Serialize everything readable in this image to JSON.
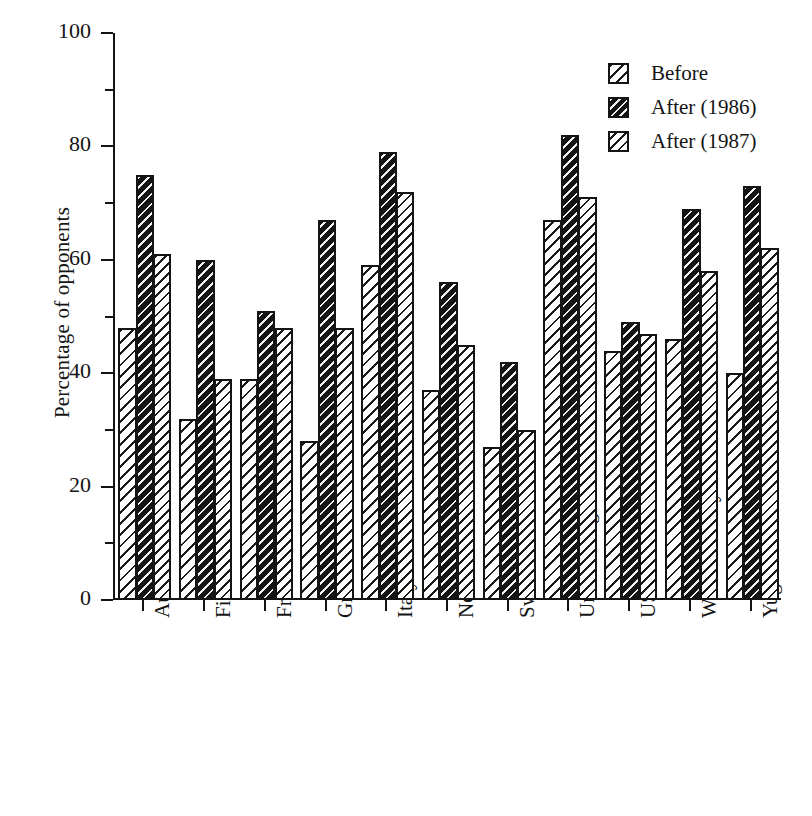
{
  "chart_data": {
    "type": "bar",
    "title": "",
    "subtitle": "",
    "xlabel": "",
    "ylabel": "Percentage of opponents",
    "ylim": [
      0,
      100
    ],
    "yticks": [
      0,
      20,
      40,
      60,
      80,
      100
    ],
    "ytick_labels": [
      "0",
      "20",
      "40",
      "60",
      "80",
      "100"
    ],
    "yminor_ticks": [
      10,
      30,
      50,
      70,
      90
    ],
    "grid": false,
    "legend_position": "top-right",
    "categories": [
      "Austria",
      "Finland",
      "France",
      "Greece",
      "Italy",
      "Netherlands",
      "Sweden",
      "United Kingdom",
      "USA",
      "West-Germany",
      "Yugoslavia"
    ],
    "series": [
      {
        "name": "Before",
        "pattern": "light-diagonal-hatch",
        "values": [
          48,
          32,
          39,
          28,
          59,
          37,
          27,
          67,
          44,
          46,
          40
        ]
      },
      {
        "name": "After (1986)",
        "pattern": "dark-diagonal-hatch",
        "values": [
          75,
          60,
          51,
          67,
          79,
          56,
          42,
          82,
          49,
          69,
          73
        ]
      },
      {
        "name": "After (1987)",
        "pattern": "medium-diagonal-hatch",
        "values": [
          61,
          39,
          48,
          48,
          72,
          45,
          30,
          71,
          47,
          58,
          62
        ]
      }
    ]
  },
  "legend": {
    "entries": [
      {
        "label": "Before"
      },
      {
        "label": "After (1986)"
      },
      {
        "label": "After (1987)"
      }
    ]
  },
  "axes": {
    "y_title": "Percentage of opponents"
  }
}
